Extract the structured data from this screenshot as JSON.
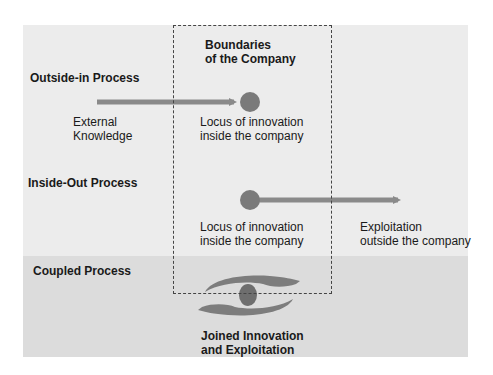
{
  "boundary": {
    "title_line1": "Boundaries",
    "title_line2": "of the Company"
  },
  "outside_in": {
    "heading": "Outside-in Process",
    "source_line1": "External",
    "source_line2": "Knowledge",
    "target_line1": "Locus of innovation",
    "target_line2": "inside the company"
  },
  "inside_out": {
    "heading": "Inside-Out Process",
    "source_line1": "Locus of innovation",
    "source_line2": "inside the company",
    "target_line1": "Exploitation",
    "target_line2": "outside the company"
  },
  "coupled": {
    "heading": "Coupled Process",
    "caption_line1": "Joined Innovation",
    "caption_line2": "and Exploitation"
  },
  "colors": {
    "panel_light": "#ececec",
    "panel_dark": "#dcdcdc",
    "arrow": "#8a8a8a",
    "node": "#7a7a7a"
  }
}
